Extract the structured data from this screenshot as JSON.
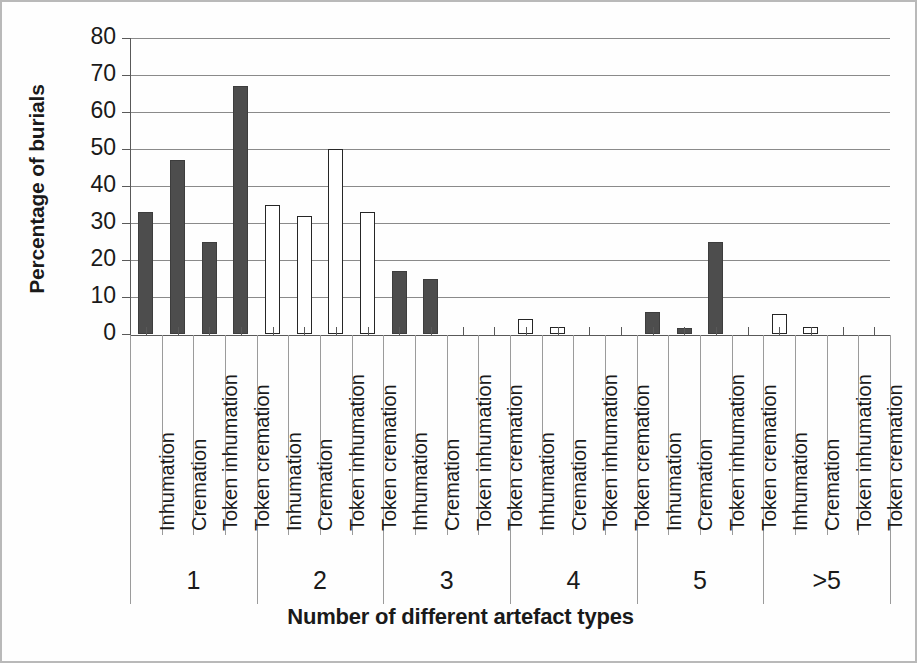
{
  "chart_data": {
    "type": "bar",
    "title": "",
    "xlabel": "Number of different artefact types",
    "ylabel": "Percentage of burials",
    "ylim": [
      0,
      80
    ],
    "ytick_labels": [
      "80",
      "70",
      "60",
      "50",
      "40",
      "30",
      "20",
      "10",
      "0"
    ],
    "ytick_values": [
      80,
      70,
      60,
      50,
      40,
      30,
      20,
      10,
      0
    ],
    "grid": true,
    "legend": "none",
    "group_labels": [
      "1",
      "2",
      "3",
      "4",
      "5",
      ">5"
    ],
    "categories": [
      "Inhumation",
      "Cremation",
      "Token inhumation",
      "Token cremation",
      "Inhumation",
      "Cremation",
      "Token inhumation",
      "Token cremation",
      "Inhumation",
      "Cremation",
      "Token inhumation",
      "Token cremation",
      "Inhumation",
      "Cremation",
      "Token inhumation",
      "Token cremation",
      "Inhumation",
      "Cremation",
      "Token inhumation",
      "Token cremation",
      "Inhumation",
      "Cremation",
      "Token inhumation",
      "Token cremation"
    ],
    "values": [
      33,
      47,
      25,
      67,
      35,
      32,
      50,
      33,
      17,
      15,
      0,
      0,
      4,
      2,
      0,
      0,
      6,
      1.5,
      25,
      0,
      5.5,
      2,
      0,
      0
    ],
    "bar_styles": [
      "filled",
      "filled",
      "filled",
      "filled",
      "open",
      "open",
      "open",
      "open",
      "filled",
      "filled",
      "filled",
      "filled",
      "open",
      "open",
      "open",
      "open",
      "filled",
      "filled",
      "filled",
      "filled",
      "open",
      "open",
      "open",
      "open"
    ],
    "groups": [
      {
        "label": "1",
        "bars": [
          {
            "category": "Inhumation",
            "value": 33,
            "style": "filled"
          },
          {
            "category": "Cremation",
            "value": 47,
            "style": "filled"
          },
          {
            "category": "Token inhumation",
            "value": 25,
            "style": "filled"
          },
          {
            "category": "Token cremation",
            "value": 67,
            "style": "filled"
          }
        ]
      },
      {
        "label": "2",
        "bars": [
          {
            "category": "Inhumation",
            "value": 35,
            "style": "open"
          },
          {
            "category": "Cremation",
            "value": 32,
            "style": "open"
          },
          {
            "category": "Token inhumation",
            "value": 50,
            "style": "open"
          },
          {
            "category": "Token cremation",
            "value": 33,
            "style": "open"
          }
        ]
      },
      {
        "label": "3",
        "bars": [
          {
            "category": "Inhumation",
            "value": 17,
            "style": "filled"
          },
          {
            "category": "Cremation",
            "value": 15,
            "style": "filled"
          },
          {
            "category": "Token inhumation",
            "value": 0,
            "style": "filled"
          },
          {
            "category": "Token cremation",
            "value": 0,
            "style": "filled"
          }
        ]
      },
      {
        "label": "4",
        "bars": [
          {
            "category": "Inhumation",
            "value": 4,
            "style": "open"
          },
          {
            "category": "Cremation",
            "value": 2,
            "style": "open"
          },
          {
            "category": "Token inhumation",
            "value": 0,
            "style": "open"
          },
          {
            "category": "Token cremation",
            "value": 0,
            "style": "open"
          }
        ]
      },
      {
        "label": "5",
        "bars": [
          {
            "category": "Inhumation",
            "value": 6,
            "style": "filled"
          },
          {
            "category": "Cremation",
            "value": 1.5,
            "style": "filled"
          },
          {
            "category": "Token inhumation",
            "value": 25,
            "style": "filled"
          },
          {
            "category": "Token cremation",
            "value": 0,
            "style": "filled"
          }
        ]
      },
      {
        "label": ">5",
        "bars": [
          {
            "category": "Inhumation",
            "value": 5.5,
            "style": "open"
          },
          {
            "category": "Cremation",
            "value": 2,
            "style": "open"
          },
          {
            "category": "Token inhumation",
            "value": 0,
            "style": "open"
          },
          {
            "category": "Token cremation",
            "value": 0,
            "style": "open"
          }
        ]
      }
    ],
    "colors": {
      "filled_bar": "#4d4d4d",
      "open_bar_fill": "#ffffff",
      "open_bar_border": "#262626",
      "gridline": "#8a8a8a",
      "axis": "#595959",
      "text": "#1a1a1a",
      "frame_border": "#b9b9b9",
      "background": "#ffffff"
    }
  }
}
